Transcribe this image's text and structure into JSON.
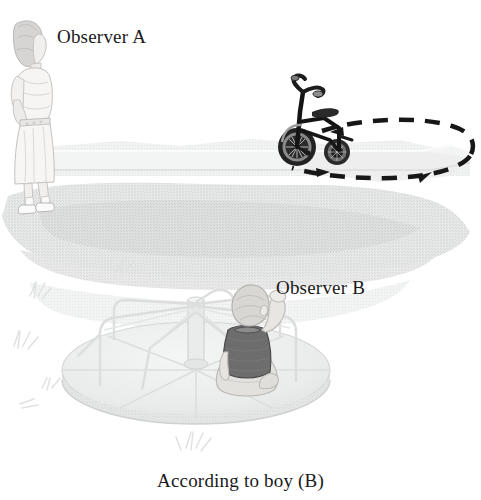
{
  "figure": {
    "caption": "According to boy (B)",
    "labels": {
      "observer_a": "Observer A",
      "observer_b": "Observer B"
    },
    "background_color": "#ffffff",
    "text_color": "#1a1a1a"
  },
  "scene": {
    "elements": [
      {
        "name": "woman-observer-a",
        "description": "Woman standing on grass, seen in profile"
      },
      {
        "name": "tricycle",
        "description": "Child's tricycle on raised path"
      },
      {
        "name": "dashed-path",
        "description": "Dashed elliptical path with arrowheads showing circular motion"
      },
      {
        "name": "grass-ground",
        "description": "Light gray textured grass ground"
      },
      {
        "name": "raised-path",
        "description": "Raised light-colored walkway ledge"
      },
      {
        "name": "merry-go-round",
        "description": "Playground merry-go-round with center post, spokes and handrails"
      },
      {
        "name": "boy-observer-b",
        "description": "Boy sitting on merry-go-round, seen from behind, arm raised"
      },
      {
        "name": "grass-tufts",
        "description": "Faint grass tufts scattered on the ground"
      }
    ],
    "colors": {
      "grass_light": "#e9eaea",
      "grass_mid": "#dcdddd",
      "grass_dark": "#d0d2d2",
      "path_top": "#f1f2f2",
      "platform": "#eceded",
      "tricycle": "#1c1c1c",
      "boy_shirt": "#6a6a6a",
      "boy_skin": "#d8d6d2",
      "dash_stroke": "#171717"
    }
  }
}
